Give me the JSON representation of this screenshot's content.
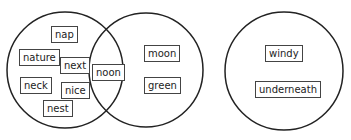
{
  "diagram": {
    "type": "venn",
    "circles": [
      {
        "id": "left",
        "cx": 65,
        "cy": 70,
        "r": 58
      },
      {
        "id": "middle",
        "cx": 146,
        "cy": 70,
        "r": 57
      },
      {
        "id": "right",
        "cx": 284,
        "cy": 71,
        "r": 59
      }
    ],
    "words": [
      {
        "text": "nap",
        "region": "left",
        "x": 51,
        "y": 26
      },
      {
        "text": "nature",
        "region": "left",
        "x": 19,
        "y": 49
      },
      {
        "text": "next",
        "region": "left",
        "x": 60,
        "y": 57
      },
      {
        "text": "neck",
        "region": "left",
        "x": 20,
        "y": 77
      },
      {
        "text": "nice",
        "region": "left",
        "x": 61,
        "y": 82
      },
      {
        "text": "nest",
        "region": "left",
        "x": 43,
        "y": 100
      },
      {
        "text": "noon",
        "region": "overlap",
        "x": 92,
        "y": 64
      },
      {
        "text": "moon",
        "region": "middle",
        "x": 144,
        "y": 45
      },
      {
        "text": "green",
        "region": "middle",
        "x": 144,
        "y": 77
      },
      {
        "text": "windy",
        "region": "right",
        "x": 265,
        "y": 45
      },
      {
        "text": "underneath",
        "region": "right",
        "x": 255,
        "y": 81
      }
    ]
  }
}
